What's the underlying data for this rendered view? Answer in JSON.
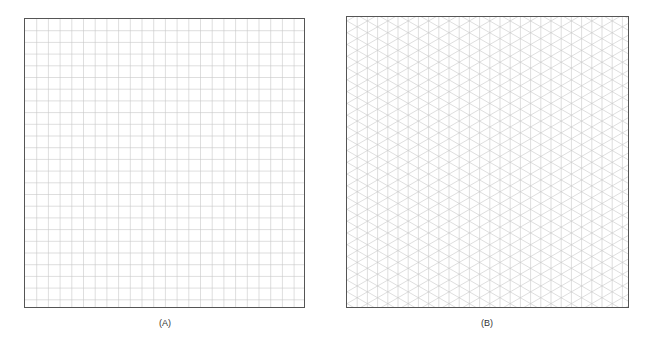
{
  "figures": [
    {
      "id": "A",
      "caption": "(A)",
      "grid_type": "square",
      "cell_size_px": 11.7,
      "line_color": "#c8c8c8",
      "border_color": "#555555"
    },
    {
      "id": "B",
      "caption": "(B)",
      "grid_type": "isometric",
      "column_spacing_px": 10.2,
      "line_color": "#c8c8c8",
      "border_color": "#555555"
    }
  ]
}
